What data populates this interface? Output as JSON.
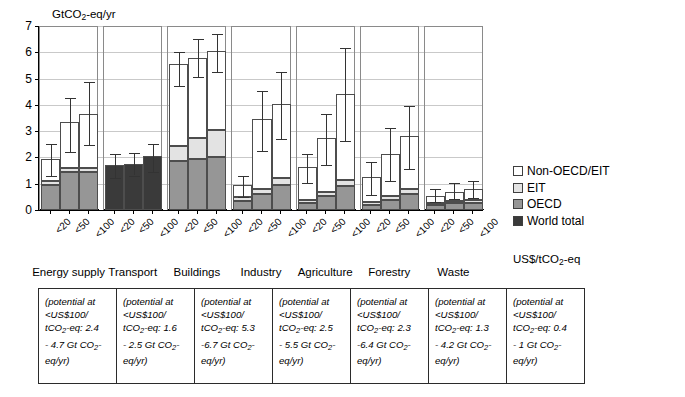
{
  "chart_data": {
    "type": "bar",
    "title": "",
    "ylabel": "GtCO2-eq/yr",
    "ylabel_rich": {
      "pre": "GtCO",
      "sub": "2",
      "post": "-eq/yr"
    },
    "xlabel": "US$/tCO2-eq",
    "xlabel_rich": {
      "pre": "US$/tCO",
      "sub": "2",
      "post": "-eq"
    },
    "ylim": [
      0,
      7
    ],
    "yticks": [
      0,
      1,
      2,
      3,
      4,
      5,
      6,
      7
    ],
    "grid": true,
    "legend_position": "right",
    "stacked": true,
    "series_names": [
      "World total",
      "OECD",
      "EIT",
      "Non-OECD/EIT"
    ],
    "cost_bins": [
      "<20",
      "<50",
      "<100"
    ],
    "categories": [
      "Energy supply",
      "Transport",
      "Buildings",
      "Industry",
      "Agriculture",
      "Forestry",
      "Waste"
    ],
    "groups": [
      {
        "category": "Energy supply",
        "bars": [
          {
            "bin": "<20",
            "oecd": 0.95,
            "eit": 1.1,
            "total": 1.95,
            "err_low": 1.35,
            "err_high": 2.55
          },
          {
            "bin": "<50",
            "oecd": 1.45,
            "eit": 1.6,
            "total": 3.35,
            "err_low": 2.25,
            "err_high": 4.3
          },
          {
            "bin": "<100",
            "oecd": 1.45,
            "eit": 1.6,
            "total": 3.65,
            "err_low": 2.5,
            "err_high": 4.9
          }
        ]
      },
      {
        "category": "Transport",
        "bars": [
          {
            "bin": "<20",
            "world": 1.7,
            "total": 1.7,
            "err_low": 1.25,
            "err_high": 2.15
          },
          {
            "bin": "<50",
            "world": 1.75,
            "total": 1.75,
            "err_low": 1.35,
            "err_high": 2.2
          },
          {
            "bin": "<100",
            "world": 2.05,
            "total": 2.05,
            "err_low": 1.5,
            "err_high": 2.55
          }
        ]
      },
      {
        "category": "Buildings",
        "bars": [
          {
            "bin": "<20",
            "oecd": 1.85,
            "eit": 2.45,
            "total": 5.55,
            "err_low": 4.75,
            "err_high": 6.05
          },
          {
            "bin": "<50",
            "oecd": 1.95,
            "eit": 2.75,
            "total": 5.8,
            "err_low": 5.1,
            "err_high": 6.55
          },
          {
            "bin": "<100",
            "oecd": 2.0,
            "eit": 3.05,
            "total": 6.05,
            "err_low": 5.3,
            "err_high": 6.75
          }
        ]
      },
      {
        "category": "Industry",
        "bars": [
          {
            "bin": "<20",
            "oecd": 0.35,
            "eit": 0.5,
            "total": 0.95,
            "err_low": 0.55,
            "err_high": 1.35
          },
          {
            "bin": "<50",
            "oecd": 0.6,
            "eit": 0.8,
            "total": 3.45,
            "err_low": 2.3,
            "err_high": 4.55
          },
          {
            "bin": "<100",
            "oecd": 0.95,
            "eit": 1.2,
            "total": 4.05,
            "err_low": 2.75,
            "err_high": 5.3
          }
        ]
      },
      {
        "category": "Agriculture",
        "bars": [
          {
            "bin": "<20",
            "oecd": 0.25,
            "eit": 0.4,
            "total": 1.65,
            "err_low": 1.05,
            "err_high": 2.15
          },
          {
            "bin": "<50",
            "oecd": 0.55,
            "eit": 0.7,
            "total": 2.75,
            "err_low": 1.75,
            "err_high": 3.7
          },
          {
            "bin": "<100",
            "oecd": 0.9,
            "eit": 1.15,
            "total": 4.4,
            "err_low": 2.65,
            "err_high": 6.2
          }
        ]
      },
      {
        "category": "Forestry",
        "bars": [
          {
            "bin": "<20",
            "oecd": 0.2,
            "eit": 0.3,
            "total": 1.25,
            "err_low": 0.6,
            "err_high": 1.85
          },
          {
            "bin": "<50",
            "oecd": 0.4,
            "eit": 0.55,
            "total": 2.15,
            "err_low": 1.15,
            "err_high": 3.15
          },
          {
            "bin": "<100",
            "oecd": 0.6,
            "eit": 0.8,
            "total": 2.8,
            "err_low": 1.6,
            "err_high": 4.0
          }
        ]
      },
      {
        "category": "Waste",
        "bars": [
          {
            "bin": "<20",
            "oecd": 0.2,
            "eit": 0.28,
            "total": 0.55,
            "err_low": 0.35,
            "err_high": 0.85
          },
          {
            "bin": "<50",
            "oecd": 0.25,
            "eit": 0.33,
            "total": 0.7,
            "err_low": 0.45,
            "err_high": 1.05
          },
          {
            "bin": "<100",
            "oecd": 0.28,
            "eit": 0.38,
            "total": 0.8,
            "err_low": 0.5,
            "err_high": 1.15
          }
        ]
      }
    ],
    "annotations": [
      {
        "category": "Energy supply",
        "text_pre": "(potential at <US$100/ tCO",
        "sub": "2",
        "text_post": "-eq: 2.4 - 4.7 Gt CO",
        "sub2": "2",
        "text_end": "-eq/yr)",
        "lines": [
          "(potential at",
          "<US$100/",
          "tCO|2|-eq: 2.4",
          "- 4.7 Gt CO|2|-",
          "eq/yr)"
        ]
      },
      {
        "category": "Transport",
        "lines": [
          "(potential at",
          "<US$100/",
          "tCO|2|-eq: 1.6",
          "- 2.5 Gt CO|2|-",
          "eq/yr)"
        ]
      },
      {
        "category": "Buildings",
        "lines": [
          "(potential at",
          "<US$100/",
          "tCO|2|-eq: 5.3",
          "-6.7 Gt CO|2|-",
          "eq/yr)"
        ]
      },
      {
        "category": "Industry",
        "lines": [
          "(potential at",
          "<US$100/",
          "tCO|2|-eq: 2.5",
          "- 5.5 Gt CO|2|-",
          "eq/yr)"
        ]
      },
      {
        "category": "Agriculture",
        "lines": [
          "(potential at",
          "<US$100/",
          "tCO|2|-eq: 2.3",
          "-6.4 Gt CO|2|-",
          "eq/yr)"
        ]
      },
      {
        "category": "Forestry",
        "lines": [
          "(potential at",
          "<US$100/",
          "tCO|2|-eq: 1.3",
          "- 4.2 Gt CO|2|-",
          "eq/yr)"
        ]
      },
      {
        "category": "Waste",
        "lines": [
          "(potential at",
          "<US$100/",
          "tCO|2|-eq: 0.4",
          "- 1 Gt CO|2|-",
          "eq/yr)"
        ]
      }
    ]
  },
  "legend": {
    "items": [
      {
        "label": "Non-OECD/EIT",
        "color": "#ffffff",
        "key": "nonoecd"
      },
      {
        "label": "EIT",
        "color": "#e3e3e3",
        "key": "eit"
      },
      {
        "label": "OECD",
        "color": "#969696",
        "key": "oecd"
      },
      {
        "label": "World total",
        "color": "#3a3a3a",
        "key": "world"
      }
    ]
  },
  "colors": {
    "nonoecd": "#ffffff",
    "eit": "#e3e3e3",
    "oecd": "#969696",
    "world": "#3a3a3a",
    "grid": "#c9c9c9",
    "axis": "#000000",
    "error": "#333333"
  }
}
